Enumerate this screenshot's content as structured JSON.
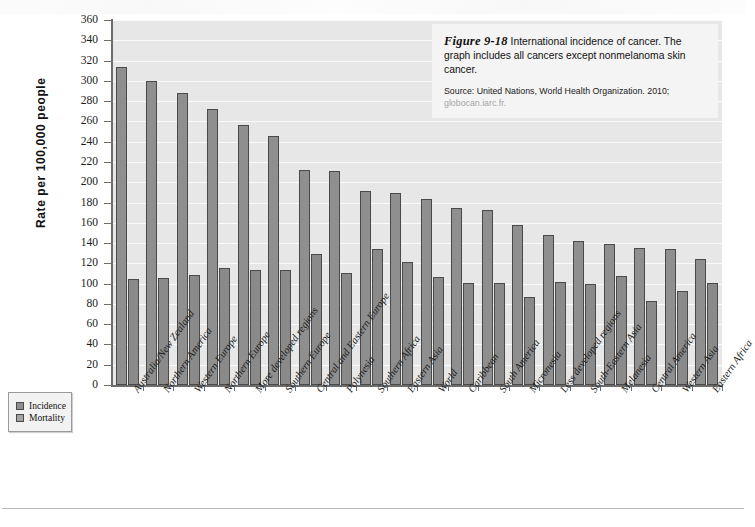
{
  "figure": {
    "number": "Figure 9-18",
    "caption": "International incidence of cancer. The graph includes all cancers except nonmelanoma skin cancer.",
    "source_prefix": "Source: United Nations, World Health Organization. 2010;",
    "source_url": "globocan.iarc.fr."
  },
  "legend": {
    "position": "bottom-left",
    "items": [
      {
        "label": "Incidence",
        "color": "#8f8f8f"
      },
      {
        "label": "Mortality",
        "color": "#a3a3a3"
      }
    ]
  },
  "axis": {
    "y_title": "Rate per 100,000 people",
    "y_ticks": [
      360,
      340,
      320,
      300,
      280,
      260,
      240,
      220,
      200,
      180,
      160,
      140,
      120,
      100,
      80,
      60,
      40,
      20,
      0
    ]
  },
  "colors": {
    "plot_background": "#e7e7e7",
    "gridline": "#fafafa",
    "axis": "#6d6d6d",
    "incidence": "#8f8f8f",
    "mortality": "#8a8a8a",
    "caption_background": "#f4f4f4"
  },
  "chart_data": {
    "type": "bar",
    "title": "International incidence of cancer",
    "xlabel": "",
    "ylabel": "Rate per 100,000 people",
    "ylim": [
      0,
      360
    ],
    "ytick_step": 20,
    "grid": true,
    "legend_position": "bottom-left",
    "categories": [
      "Australia/New Zealand",
      "Northern America",
      "Western Europe",
      "Northern Europe",
      "More developed regions",
      "Southern Europe",
      "Central and Eastern Europe",
      "Polynesia",
      "Southern Africa",
      "Eastern Asia",
      "World",
      "Caribbean",
      "South America",
      "Micronesia",
      "Less developed regions",
      "South-Eastern Asia",
      "Melanesia",
      "Central America",
      "Western Asia",
      "Eastern Africa"
    ],
    "series": [
      {
        "name": "Incidence",
        "values": [
          314,
          300,
          288,
          272,
          256,
          246,
          212,
          211,
          191,
          189,
          183,
          175,
          173,
          158,
          148,
          142,
          139,
          135,
          134,
          124
        ]
      },
      {
        "name": "Mortality",
        "values": [
          105,
          106,
          109,
          115,
          113,
          113,
          129,
          110,
          134,
          121,
          107,
          101,
          101,
          87,
          102,
          100,
          108,
          83,
          93,
          101
        ]
      }
    ]
  }
}
